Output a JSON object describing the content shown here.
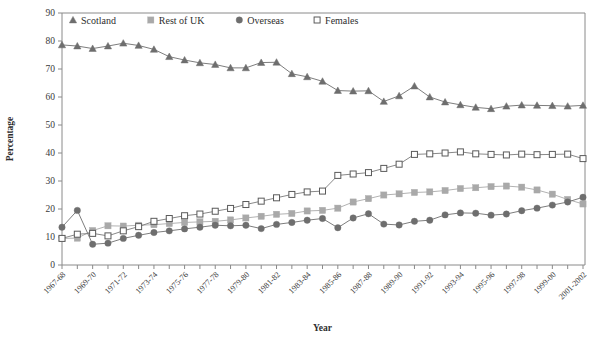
{
  "chart_data": {
    "type": "line",
    "title": "",
    "xlabel": "Year",
    "ylabel": "Percentage",
    "ylim": [
      0,
      90
    ],
    "ytick_step": 10,
    "yticks": [
      0,
      10,
      20,
      30,
      40,
      50,
      60,
      70,
      80,
      90
    ],
    "grid": false,
    "legend_position": "top-inside-left",
    "x": [
      "1967-68",
      "1968-69",
      "1969-70",
      "1970-71",
      "1971-72",
      "1972-73",
      "1973-74",
      "1974-75",
      "1975-76",
      "1976-77",
      "1977-78",
      "1978-79",
      "1979-80",
      "1980-81",
      "1981-82",
      "1982-83",
      "1983-84",
      "1984-85",
      "1985-86",
      "1986-87",
      "1987-88",
      "1988-89",
      "1989-90",
      "1990-91",
      "1991-92",
      "1992-93",
      "1993-94",
      "1994-95",
      "1995-96",
      "1996-97",
      "1997-98",
      "1998-99",
      "1999-00",
      "2000-01",
      "2001-2002"
    ],
    "xtick_labels": [
      "1967-68",
      "1969-70",
      "1971-72",
      "1973-74",
      "1975-76",
      "1977-78",
      "1979-80",
      "1981-82",
      "1983-84",
      "1985-86",
      "1987-88",
      "1989-90",
      "1991-92",
      "1993-94",
      "1995-96",
      "1997-98",
      "1999-00",
      "2001-2002"
    ],
    "xtick_label_indices": [
      0,
      2,
      4,
      6,
      8,
      10,
      12,
      14,
      16,
      18,
      20,
      22,
      24,
      26,
      28,
      30,
      32,
      34
    ],
    "series": [
      {
        "name": "Scotland",
        "marker": "triangle",
        "color": "#6e6e6e",
        "values": [
          78.6,
          78.2,
          77.3,
          78.2,
          79.2,
          78.4,
          77.0,
          74.4,
          73.2,
          72.2,
          71.6,
          70.4,
          70.4,
          72.3,
          72.4,
          68.3,
          67.2,
          65.6,
          62.3,
          62.1,
          62.2,
          58.4,
          60.4,
          63.9,
          60.0,
          58.2,
          57.2,
          56.3,
          55.8,
          56.7,
          57.1,
          57.0,
          56.9,
          56.7,
          57.0
        ]
      },
      {
        "name": "Rest of UK",
        "marker": "square-filled",
        "color": "#a9a9a9",
        "values": [
          9.5,
          9.6,
          12.3,
          14.0,
          13.9,
          14.2,
          14.4,
          14.8,
          15.2,
          15.4,
          15.6,
          16.1,
          16.8,
          17.4,
          18.1,
          18.4,
          19.3,
          19.5,
          20.3,
          22.5,
          23.7,
          25.0,
          25.4,
          25.9,
          26.1,
          26.6,
          27.3,
          27.6,
          28.0,
          28.2,
          27.8,
          26.8,
          25.3,
          23.4,
          21.8
        ]
      },
      {
        "name": "Overseas",
        "marker": "circle",
        "color": "#6e6e6e",
        "values": [
          13.5,
          19.5,
          7.4,
          7.8,
          9.5,
          10.6,
          11.6,
          12.2,
          12.9,
          13.5,
          14.2,
          14.0,
          14.2,
          13.0,
          14.5,
          15.2,
          16.0,
          16.6,
          13.3,
          16.8,
          18.3,
          14.6,
          14.3,
          15.6,
          16.0,
          17.9,
          18.6,
          18.5,
          17.8,
          18.2,
          19.4,
          20.3,
          21.4,
          22.5,
          24.2
        ]
      },
      {
        "name": "Females",
        "marker": "square-open",
        "color": "#5a5a5a",
        "values": [
          9.5,
          11.0,
          11.3,
          10.4,
          12.2,
          13.7,
          15.6,
          16.6,
          17.6,
          18.2,
          19.2,
          20.2,
          21.6,
          22.8,
          24.0,
          25.2,
          26.1,
          26.4,
          32.0,
          32.5,
          33.0,
          34.5,
          36.0,
          39.5,
          39.7,
          40.0,
          40.4,
          39.7,
          39.5,
          39.3,
          39.6,
          39.4,
          39.5,
          39.6,
          38.0
        ]
      }
    ]
  },
  "legend": {
    "items": [
      {
        "label": "Scotland",
        "marker": "triangle",
        "color": "#6e6e6e"
      },
      {
        "label": "Rest of UK",
        "marker": "square-filled",
        "color": "#a9a9a9"
      },
      {
        "label": "Overseas",
        "marker": "circle",
        "color": "#6e6e6e"
      },
      {
        "label": "Females",
        "marker": "square-open",
        "color": "#5a5a5a"
      }
    ]
  },
  "colors": {
    "axis": "#8a8a8a",
    "text": "#3a3a3a",
    "dark_gray": "#6e6e6e",
    "light_gray": "#a9a9a9",
    "open_marker_stroke": "#5a5a5a",
    "background": "#ffffff"
  }
}
